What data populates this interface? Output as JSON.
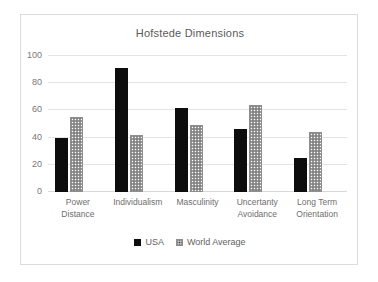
{
  "chart_data": {
    "type": "bar",
    "title": "Hofstede Dimensions",
    "xlabel": "",
    "ylabel": "",
    "ylim": [
      0,
      100
    ],
    "yticks": [
      0,
      20,
      40,
      60,
      80,
      100
    ],
    "grid": true,
    "legend_position": "bottom",
    "categories": [
      "Power Distance",
      "Individualism",
      "Masculinity",
      "Uncertanty Avoidance",
      "Long Term Orientation"
    ],
    "category_lines": [
      [
        "Power",
        "Distance"
      ],
      [
        "Individualism"
      ],
      [
        "Masculinity"
      ],
      [
        "Uncertanty",
        "Avoidance"
      ],
      [
        "Long Term",
        "Orientation"
      ]
    ],
    "series": [
      {
        "name": "USA",
        "color": "#0d0d0d",
        "pattern": "solid",
        "values": [
          40,
          91,
          62,
          46,
          25
        ]
      },
      {
        "name": "World Average",
        "color": "#9a9a9a",
        "pattern": "dotted",
        "values": [
          55,
          42,
          49,
          64,
          44
        ]
      }
    ]
  },
  "frame": {
    "border_color": "#dcdcdc",
    "background": "#ffffff"
  }
}
